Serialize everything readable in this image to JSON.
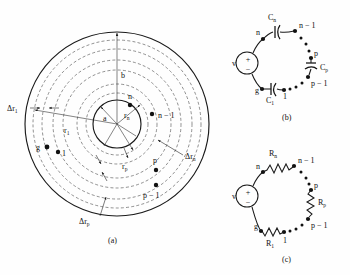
{
  "figure": {
    "panels": [
      {
        "id": "a",
        "caption": "(a)",
        "name": "concentric-ring-discretization",
        "labels": {
          "inner_radius": "a",
          "outer_radius": "b",
          "r1": "r",
          "r1_sub": "1",
          "rn": "r",
          "rn_sub": "n",
          "rp": "r",
          "rp_sub": "p",
          "dr1": "Δr",
          "dr1_sub": "1",
          "drn": "Δr",
          "drn_sub": "n",
          "drp": "Δr",
          "drp_sub": "p",
          "node_g": "g",
          "node_1": "1",
          "node_n": "n",
          "node_n_minus_1": "n − 1",
          "node_p": "p",
          "node_p_minus_1": "p − 1"
        }
      },
      {
        "id": "b",
        "caption": "(b)",
        "name": "capacitive-ladder-circuit",
        "source_label": "v",
        "source_plus": "+",
        "source_minus": "−",
        "components": [
          {
            "label": "C",
            "sub": "n",
            "type": "capacitor"
          },
          {
            "label": "C",
            "sub": "p",
            "type": "capacitor"
          },
          {
            "label": "C",
            "sub": "1",
            "type": "capacitor"
          }
        ],
        "nodes": [
          "n",
          "n − 1",
          "p",
          "p − 1",
          "1",
          "g"
        ]
      },
      {
        "id": "c",
        "caption": "(c)",
        "name": "resistive-ladder-circuit",
        "source_label": "v",
        "source_plus": "+",
        "source_minus": "−",
        "components": [
          {
            "label": "R",
            "sub": "n",
            "type": "resistor"
          },
          {
            "label": "R",
            "sub": "p",
            "type": "resistor"
          },
          {
            "label": "R",
            "sub": "1",
            "type": "resistor"
          }
        ],
        "nodes": [
          "n",
          "n − 1",
          "p",
          "p − 1",
          "1",
          "g"
        ]
      }
    ]
  },
  "colors": {
    "ink": "#1a1a1a",
    "dashed": "#555555",
    "background": "#fefefe"
  }
}
